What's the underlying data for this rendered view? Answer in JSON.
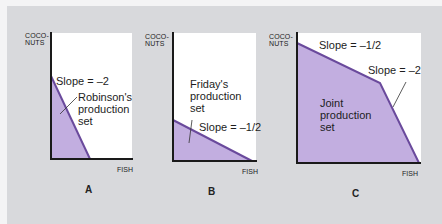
{
  "figure": {
    "colors": {
      "background": "#d8d9dc",
      "plot_area": "#ffffff",
      "fill": "#c2aee0",
      "frontier_line": "#6a4a9c",
      "axis": "#1a1a1a"
    },
    "panels": [
      {
        "letter": "A",
        "y_axis_label_1": "COCO-",
        "y_axis_label_2": "NUTS",
        "x_axis_label": "FISH",
        "slope_label": "Slope = –2",
        "set_label_1": "Robinson's",
        "set_label_2": "production",
        "set_label_3": "set"
      },
      {
        "letter": "B",
        "y_axis_label_1": "COCO-",
        "y_axis_label_2": "NUTS",
        "x_axis_label": "FISH",
        "slope_label": "Slope = –1/2",
        "set_label_1": "Friday's",
        "set_label_2": "production",
        "set_label_3": "set"
      },
      {
        "letter": "C",
        "y_axis_label_1": "COCO-",
        "y_axis_label_2": "NUTS",
        "x_axis_label": "FISH",
        "slope_label_1": "Slope = –1/2",
        "slope_label_2": "Slope = –2",
        "set_label_1": "Joint",
        "set_label_2": "production",
        "set_label_3": "set"
      }
    ]
  }
}
